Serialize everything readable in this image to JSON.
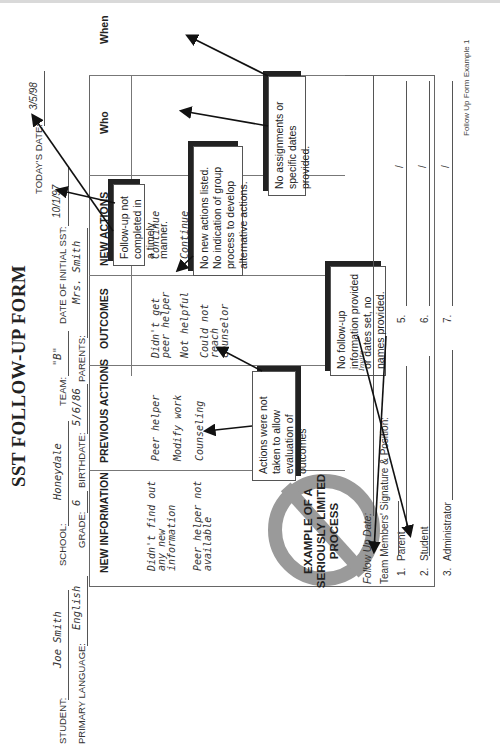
{
  "form": {
    "title": "SST FOLLOW-UP FORM",
    "header": {
      "todays_date_label": "TODAY'S DATE:",
      "todays_date": "3/5/98",
      "student_label": "STUDENT:",
      "student": "Joe Smith",
      "school_label": "SCHOOL:",
      "school": "Honeydale",
      "team_label": "TEAM:",
      "team": "\"B\"",
      "date_initial_sst_label": "DATE OF INITIAL SST:",
      "date_initial_sst": "10/1/97",
      "primary_language_label": "PRIMARY LANGUAGE:",
      "primary_language": "English",
      "grade_label": "GRADE:",
      "grade": "6",
      "birthdate_label": "BIRTHDATE:",
      "birthdate": "5/6/86",
      "parents_label": "PARENTS:",
      "parents": "Mrs. Smith"
    },
    "table": {
      "columns": [
        "NEW INFORMATION",
        "PREVIOUS ACTIONS",
        "OUTCOMES",
        "NEW ACTIONS",
        "Who",
        "When"
      ],
      "new_information": [
        "Didn't find out any new information",
        "Peer helper not available"
      ],
      "previous_actions": [
        "Peer helper",
        "Modify work",
        "Counseling"
      ],
      "outcomes": [
        "Didn't get peer helper",
        "Not helpful",
        "Could not reach counselor"
      ],
      "new_actions": [
        "Continue",
        "Continue"
      ]
    },
    "stamp_text": "EXAMPLE OF A SERIOUSLY LIMITED PROCESS",
    "follow_up_date_label": "Follow Up Date:",
    "follow_up_date": "Invite",
    "signatures": {
      "heading": "Team Members' Signature & Position:",
      "left": [
        {
          "num": "1.",
          "role": "Parent"
        },
        {
          "num": "2.",
          "role": "Student"
        },
        {
          "num": "3.",
          "role": "Administrator"
        }
      ],
      "right": [
        {
          "num": "5.",
          "role": ""
        },
        {
          "num": "6.",
          "role": ""
        },
        {
          "num": "7.",
          "role": ""
        }
      ],
      "slash": "/"
    },
    "footer": "Follow Up Form Example 1"
  },
  "callouts": [
    {
      "id": "timely",
      "text": "Follow-up not completed in a timely manner."
    },
    {
      "id": "no-new-actions",
      "text": "No new actions listed. No indication of group process to develop alternative actions."
    },
    {
      "id": "no-assignments",
      "text": "No assignments or specific dates provided."
    },
    {
      "id": "not-taken",
      "text": "Actions were not taken to allow evaluation of outcomes"
    },
    {
      "id": "no-followup",
      "text": "No follow-up information provided or dates set, no names provided."
    }
  ]
}
